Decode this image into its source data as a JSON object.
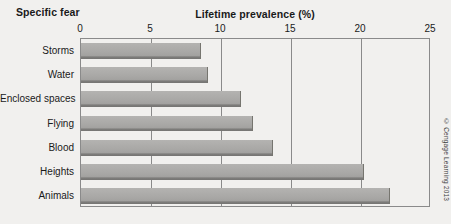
{
  "figure": {
    "category_axis_title": "Specific fear",
    "credit": "© Cengage Learning 2013"
  },
  "chart_data": {
    "type": "bar",
    "orientation": "horizontal",
    "title": "Lifetime prevalence (%)",
    "xlabel": "Lifetime prevalence (%)",
    "ylabel": "Specific fear",
    "categories": [
      "Storms",
      "Water",
      "Enclosed spaces",
      "Flying",
      "Blood",
      "Heights",
      "Animals"
    ],
    "values": [
      8.6,
      9.1,
      11.4,
      12.3,
      13.7,
      20.2,
      22.1
    ],
    "xlim": [
      0,
      25
    ],
    "xticks": [
      0,
      5,
      10,
      15,
      20,
      25
    ],
    "xtick_labels": [
      "0",
      "5",
      "10",
      "15",
      "20",
      "25"
    ],
    "grid": "vertical",
    "legend": "none",
    "bar_color": "#a9a8a6",
    "bar_edge_color": "#76756f",
    "background_color": "#f1f0ee",
    "axis_color": "#8a8a8a"
  }
}
